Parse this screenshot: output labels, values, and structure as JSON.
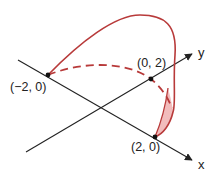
{
  "diagram": {
    "type": "3d-surface-curve-sketch",
    "colors": {
      "axis": "#222222",
      "curve": "#b83a3a",
      "fill": "#f2bcbc",
      "point": "#111111",
      "text": "#222222"
    },
    "axes": {
      "x_label": "x",
      "y_label": "y"
    },
    "points": [
      {
        "label": "(−2, 0)"
      },
      {
        "label": "(0, 2)"
      },
      {
        "label": "(2, 0)"
      }
    ]
  }
}
